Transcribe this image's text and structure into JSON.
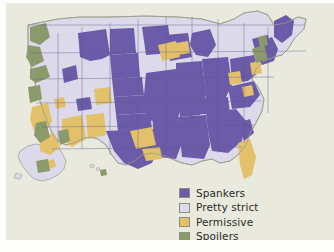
{
  "figure": {
    "background_color": "#e9e9dd",
    "outer_color": "#ffffff",
    "border_color": "#c9c9ba"
  },
  "legend": {
    "items": [
      {
        "label": "Spankers",
        "color": "#6b5ba8",
        "swatch_name": "legend-swatch-spankers"
      },
      {
        "label": "Pretty strict",
        "color": "#dcdaea",
        "swatch_name": "legend-swatch-pretty-strict"
      },
      {
        "label": "Permissive",
        "color": "#e3c06a",
        "swatch_name": "legend-swatch-permissive"
      },
      {
        "label": "Spoilers",
        "color": "#8a9a6b",
        "swatch_name": "legend-swatch-spoilers"
      }
    ]
  },
  "map": {
    "title": "",
    "region": "United States",
    "border_color": "#5a5a8c",
    "coastline_color": "#9a9a8a",
    "categories": [
      "Spankers",
      "Pretty strict",
      "Permissive",
      "Spoilers"
    ],
    "colors": {
      "spankers": "#6b5ba8",
      "pretty_strict": "#dcdaea",
      "permissive": "#e3c06a",
      "spoilers": "#8a9a6b"
    },
    "insets": [
      "Alaska",
      "Hawaii"
    ]
  }
}
